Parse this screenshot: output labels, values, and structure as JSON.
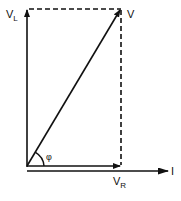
{
  "diagram": {
    "labels": {
      "v_l": "V",
      "v_l_sub": "L",
      "v": "V",
      "v_r": "V",
      "v_r_sub": "R",
      "current": "I",
      "angle": "φ"
    },
    "colors": {
      "stroke": "#111111",
      "background": "#ffffff"
    }
  }
}
